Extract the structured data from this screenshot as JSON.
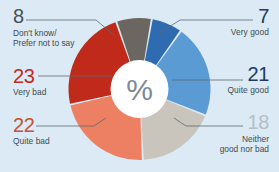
{
  "background_color": "#dbeaf4",
  "center": {
    "glyph": "%",
    "glyph_color": "#7b8a93",
    "disc_color": "#ffffff"
  },
  "chart_data": {
    "type": "pie",
    "title": "",
    "subtitle": "",
    "xlabel": "",
    "ylabel": "",
    "unit": "%",
    "legend_position": "callout-labels",
    "grid": false,
    "donut": true,
    "categories": [
      "Very good",
      "Quite good",
      "Neither good nor bad",
      "Quite bad",
      "Very bad",
      "Don't know/ Prefer not to say"
    ],
    "values": [
      7,
      21,
      18,
      22,
      23,
      8
    ],
    "total": 99,
    "colors": [
      "#2f6bb0",
      "#5a9bd4",
      "#c9c5bc",
      "#ed7f63",
      "#bf2a1b",
      "#6b665f"
    ],
    "label_colors": [
      "#1f3b63",
      "#1f3b63",
      "#b4bec6",
      "#c8512f",
      "#bf2a1b",
      "#4a4f54"
    ],
    "slices": [
      {
        "label": "Very good",
        "value": 7,
        "color": "#2f6bb0",
        "number_color": "#1f3b63"
      },
      {
        "label": "Quite good",
        "value": 21,
        "color": "#5a9bd4",
        "number_color": "#1f3b63"
      },
      {
        "label": "Neither good nor bad",
        "value": 18,
        "color": "#c9c5bc",
        "number_color": "#b4bec6"
      },
      {
        "label": "Quite bad",
        "value": 22,
        "color": "#ed7f63",
        "number_color": "#c8512f"
      },
      {
        "label": "Very bad",
        "value": 23,
        "color": "#bf2a1b",
        "number_color": "#bf2a1b"
      },
      {
        "label": "Don't know/ Prefer not to say",
        "value": 8,
        "color": "#6b665f",
        "number_color": "#4a4f54"
      }
    ]
  },
  "labels": {
    "dontknow": {
      "number": "8",
      "caption_line1": "Don't know/",
      "caption_line2": "Prefer not to say"
    },
    "verybad": {
      "number": "23",
      "caption": "Very bad"
    },
    "quitebad": {
      "number": "22",
      "caption": "Quite bad"
    },
    "verygood": {
      "number": "7",
      "caption": "Very good"
    },
    "quitegood": {
      "number": "21",
      "caption": "Quite good"
    },
    "neither": {
      "number": "18",
      "caption_line1": "Neither",
      "caption_line2": "good nor bad"
    }
  }
}
